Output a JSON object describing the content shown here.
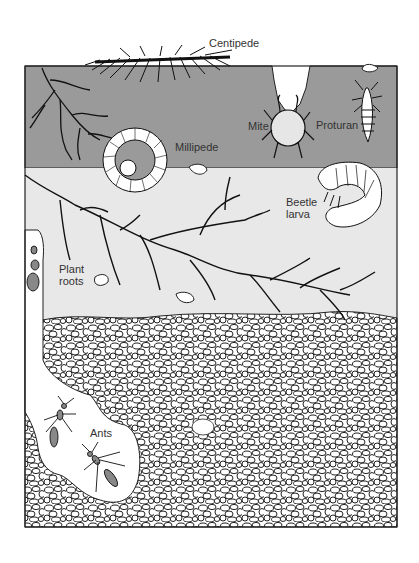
{
  "diagram": {
    "type": "soil-cross-section",
    "colors": {
      "topsoil": "#9a9a9a",
      "subsoil": "#e8e8e8",
      "gravel_fill": "#ffffff",
      "outline": "#222222",
      "ant_body": "#888888"
    },
    "layers": [
      {
        "name": "topsoil",
        "label": ""
      },
      {
        "name": "subsoil",
        "label": ""
      },
      {
        "name": "gravel",
        "label": ""
      }
    ],
    "labels": {
      "centipede": "Centipede",
      "mite": "Mite",
      "proturan": "Proturan",
      "millipede": "Millipede",
      "beetle_larva": "Beetle\nlarva",
      "plant_roots": "Plant\nroots",
      "ants": "Ants"
    }
  }
}
